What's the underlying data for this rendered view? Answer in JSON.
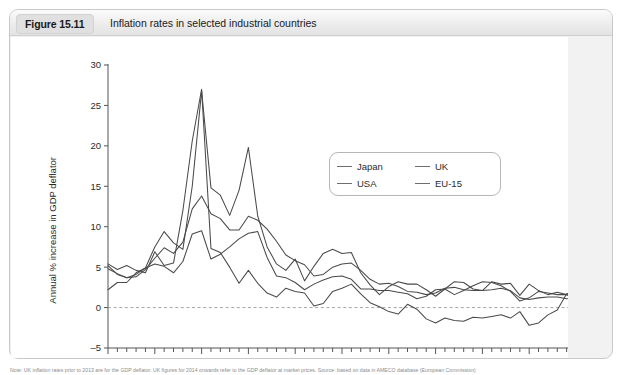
{
  "figure": {
    "badge_label": "Figure 15.11",
    "title": "Inflation rates in selected industrial countries",
    "footnote": "Note: UK inflation rates prior to 2013 are for the GDP deflator. UK figures for 2014 onwards refer to the GDP deflator at market prices. Source: based on data in AMECO database (European Commission)"
  },
  "legend": {
    "position": "inside-upper-right",
    "entries": [
      {
        "label": "Japan",
        "color": "#4a4a4a"
      },
      {
        "label": "UK",
        "color": "#4a4a4a"
      },
      {
        "label": "USA",
        "color": "#4a4a4a"
      },
      {
        "label": "EU-15",
        "color": "#4a4a4a"
      }
    ]
  },
  "chart_data": {
    "type": "line",
    "title": "Inflation rates in selected industrial countries",
    "xlabel": "",
    "ylabel": "Annual % increase in GDP deflator",
    "xlim": [
      1965,
      2015
    ],
    "ylim": [
      -5,
      30
    ],
    "yticks": [
      -5,
      0,
      5,
      10,
      15,
      20,
      25,
      30
    ],
    "ytick_labels": [
      "–5",
      "0",
      "5",
      "10",
      "15",
      "20",
      "25",
      "30"
    ],
    "xticks": [
      1965,
      1970,
      1975,
      1980,
      1985,
      1990,
      1995,
      2000,
      2005,
      2010,
      2015
    ],
    "xtick_labels": [
      "1965",
      "1970",
      "1975",
      "1980",
      "1985",
      "1990",
      "1995",
      "2000",
      "2005",
      "2010",
      "2015"
    ],
    "x_minor_tick_interval": 1,
    "grid": false,
    "zero_reference_line": true,
    "x": [
      1965,
      1966,
      1967,
      1968,
      1969,
      1970,
      1971,
      1972,
      1973,
      1974,
      1975,
      1976,
      1977,
      1978,
      1979,
      1980,
      1981,
      1982,
      1983,
      1984,
      1985,
      1986,
      1987,
      1988,
      1989,
      1990,
      1991,
      1992,
      1993,
      1994,
      1995,
      1996,
      1997,
      1998,
      1999,
      2000,
      2001,
      2002,
      2003,
      2004,
      2005,
      2006,
      2007,
      2008,
      2009,
      2010,
      2011,
      2012,
      2013,
      2014,
      2015
    ],
    "series": [
      {
        "name": "Japan",
        "color": "#4a4a4a",
        "values": [
          5.4,
          4.7,
          5.2,
          4.6,
          4.3,
          6.9,
          5.2,
          5.5,
          12.0,
          20.6,
          27.0,
          7.3,
          6.8,
          5.0,
          3.0,
          4.6,
          3.0,
          1.8,
          1.3,
          2.4,
          2.0,
          1.8,
          0.2,
          0.5,
          2.0,
          2.4,
          2.9,
          1.7,
          0.6,
          0.1,
          -0.5,
          -0.8,
          0.4,
          -0.2,
          -1.4,
          -1.9,
          -1.3,
          -1.6,
          -1.7,
          -1.2,
          -1.3,
          -1.1,
          -0.9,
          -1.3,
          -0.5,
          -2.2,
          -1.9,
          -0.9,
          -0.3,
          1.7,
          2.1
        ]
      },
      {
        "name": "UK",
        "color": "#4a4a4a",
        "values": [
          5.2,
          4.1,
          3.7,
          4.1,
          4.9,
          7.5,
          9.4,
          8.0,
          7.2,
          15.0,
          26.8,
          14.8,
          13.9,
          11.4,
          14.5,
          19.8,
          11.3,
          7.5,
          5.4,
          4.6,
          6.0,
          3.3,
          5.1,
          6.7,
          7.2,
          6.7,
          6.8,
          4.3,
          2.8,
          1.6,
          2.6,
          3.2,
          2.9,
          2.9,
          2.2,
          1.4,
          2.3,
          3.2,
          3.1,
          2.3,
          2.1,
          3.2,
          2.9,
          3.0,
          1.5,
          2.9,
          2.1,
          1.6,
          1.9,
          1.6,
          1.4
        ]
      },
      {
        "name": "USA",
        "color": "#4a4a4a",
        "values": [
          2.2,
          3.1,
          3.1,
          4.3,
          4.9,
          5.4,
          5.1,
          4.3,
          5.7,
          9.1,
          9.5,
          6.0,
          6.6,
          7.5,
          8.5,
          9.2,
          9.4,
          6.2,
          3.9,
          3.7,
          3.1,
          2.2,
          2.9,
          3.4,
          3.8,
          3.9,
          3.5,
          2.3,
          2.3,
          2.1,
          2.1,
          1.9,
          1.7,
          1.1,
          1.4,
          2.2,
          2.3,
          1.6,
          2.1,
          2.7,
          3.2,
          3.1,
          2.7,
          2.0,
          0.8,
          1.2,
          2.0,
          1.8,
          1.6,
          1.6,
          1.0
        ]
      },
      {
        "name": "EU-15",
        "color": "#4a4a4a",
        "values": [
          4.8,
          4.2,
          3.7,
          3.8,
          4.7,
          6.1,
          7.4,
          6.7,
          8.1,
          12.2,
          13.8,
          11.6,
          11.0,
          9.6,
          9.6,
          11.3,
          10.8,
          9.7,
          8.2,
          6.5,
          5.8,
          5.3,
          3.9,
          4.1,
          5.0,
          5.4,
          5.5,
          4.6,
          3.5,
          2.9,
          3.0,
          2.6,
          2.0,
          1.9,
          1.6,
          1.8,
          2.4,
          2.5,
          2.2,
          2.1,
          2.1,
          2.2,
          2.4,
          2.1,
          1.2,
          1.0,
          1.2,
          1.3,
          1.3,
          1.1,
          1.3
        ]
      }
    ]
  }
}
